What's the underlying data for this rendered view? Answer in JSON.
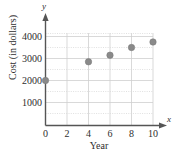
{
  "chart_data": {
    "type": "scatter",
    "title": "",
    "xlabel": "Year",
    "ylabel": "Cost (in dollars)",
    "x_axis_variable": "x",
    "y_axis_variable": "y",
    "xlim": [
      0,
      11.2
    ],
    "ylim": [
      0,
      4500
    ],
    "xticks": [
      0,
      2,
      4,
      6,
      8,
      10
    ],
    "xtick_labels": [
      "0",
      "2",
      "4",
      "6",
      "8",
      "10"
    ],
    "yticks": [
      1000,
      2000,
      3000,
      4000
    ],
    "ytick_labels": [
      "1000",
      "2000",
      "3000",
      "4000"
    ],
    "grid": true,
    "grid_color": "#c9c9c9",
    "legend": null,
    "point_color": "#8a8a8a",
    "axis_color": "#555555",
    "points": [
      {
        "x": 0,
        "y": 2000
      },
      {
        "x": 4,
        "y": 2850
      },
      {
        "x": 6,
        "y": 3150
      },
      {
        "x": 8,
        "y": 3500
      },
      {
        "x": 10,
        "y": 3750
      }
    ]
  },
  "labels": {
    "x_title": "Year",
    "y_title": "Cost (in dollars)",
    "x_var": "x",
    "y_var": "y",
    "xtick_0": "0",
    "xtick_1": "2",
    "xtick_2": "4",
    "xtick_3": "6",
    "xtick_4": "8",
    "xtick_5": "10",
    "ytick_0": "1000",
    "ytick_1": "2000",
    "ytick_2": "3000",
    "ytick_3": "4000"
  }
}
